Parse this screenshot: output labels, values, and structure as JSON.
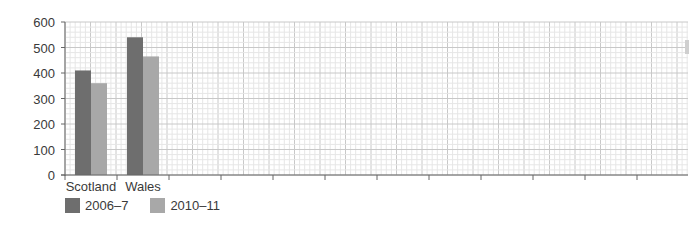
{
  "chart_data": {
    "type": "bar",
    "title": "",
    "xlabel": "",
    "ylabel": "",
    "categories": [
      "Scotland",
      "Wales"
    ],
    "series": [
      {
        "name": "2006–7",
        "color": "#6e6e6e",
        "values": [
          410,
          540
        ]
      },
      {
        "name": "2010–11",
        "color": "#a8a8a8",
        "values": [
          360,
          465
        ]
      }
    ],
    "ylim": [
      0,
      600
    ],
    "yticks": [
      0,
      100,
      200,
      300,
      400,
      500,
      600
    ],
    "grid": true,
    "legend_position": "bottom-left",
    "empty_category_slots": 10
  },
  "legend": {
    "items": [
      {
        "label": "2006–7",
        "color": "#6e6e6e"
      },
      {
        "label": "2010–11",
        "color": "#a8a8a8"
      }
    ]
  },
  "colors": {
    "grid_minor": "#e6e6e6",
    "grid_major": "#c8c8c8",
    "axis": "#666666"
  }
}
